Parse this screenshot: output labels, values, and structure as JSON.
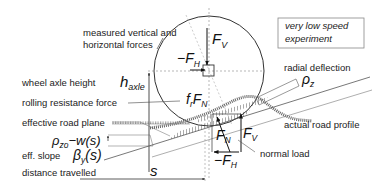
{
  "diagram": {
    "note_box": {
      "line1": "very low speed",
      "line2": "experiment"
    },
    "labels": {
      "measured_forces_line1": "measured vertical and",
      "measured_forces_line2": "horizontal forces",
      "wheel_axle_height": "wheel axle height",
      "rolling_resistance_force": "rolling resistance force",
      "effective_road_plane": "effective road plane",
      "eff_slope": "eff. slope",
      "distance_travelled": "distance travelled",
      "radial_deflection": "radial deflection",
      "actual_road_profile": "actual road profile",
      "normal_load": "normal load"
    },
    "symbols": {
      "F_V_main": "F",
      "F_V_main_sub": "V",
      "minus_F_H_top": "−F",
      "minus_F_H_top_sub": "H",
      "h_axle": "h",
      "h_axle_sub": "axle",
      "fr_FN": "f",
      "fr_sub": "r",
      "fr_FN_F": "F",
      "fr_FN_sub": "N",
      "rho_z": "ρ",
      "rho_z_sub": "z",
      "rho_zo_w": "ρ",
      "rho_zo_sub": "zo",
      "rho_zo_rest": "−w(s)",
      "beta": "β",
      "beta_sub": "y",
      "beta_rest": "(s)",
      "s": "s",
      "F_N": "F",
      "F_N_sub": "N",
      "F_V_low": "F",
      "F_V_low_sub": "V",
      "minus_F_H_low": "−F",
      "minus_F_H_low_sub": "H"
    },
    "colors": {
      "line": "#333333",
      "dashed": "#888888",
      "hatch": "#555555"
    }
  }
}
